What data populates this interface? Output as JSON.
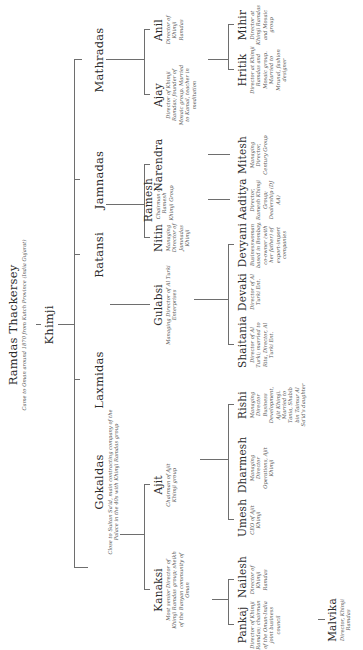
{
  "root": {
    "name": "Ramdas Thackersey",
    "desc": "Came to Oman around 1870 from Kutch Province (India Gujarat)"
  },
  "gen1": {
    "name": "Khimji"
  },
  "gen2": [
    {
      "name": "Gokaldas",
      "desc": "Close to Sultan Sa'id, main contracting company of the Palace in the 40s with Khimji Ramdas group"
    },
    {
      "name": "Laxmidas",
      "desc": ""
    },
    {
      "name": "Ratansi",
      "desc": ""
    },
    {
      "name": "Jamnadas",
      "desc": ""
    },
    {
      "name": "Mathradas",
      "desc": ""
    }
  ],
  "gen3": [
    {
      "name": "Kanaksi",
      "desc": "Most senior Director of Khimji Ramdas group; sheikh of the Banyan community of Oman"
    },
    {
      "name": "Ajit",
      "desc": "Chairman of Ajit Khimji group"
    },
    {
      "name": "Gulabsi",
      "desc": "Managing Director of Al Turki Enterprises"
    },
    {
      "name": "Nitin",
      "desc": "Managing Director of Jamnadas Khimji"
    },
    {
      "name": "Ramesh",
      "desc": "Chairman of Ramesh Khimji Group"
    },
    {
      "name": "Narendra",
      "desc": ""
    },
    {
      "name": "Ajay",
      "desc": "Director of Khimji Ramdas; founder of Mosaic group. Married to Kamal, teacher in meditation"
    },
    {
      "name": "Anil",
      "desc": "Director of Khimji Ramdas"
    }
  ],
  "gen4": [
    {
      "name": "Pankaj",
      "desc": "Director of Khimji Ramdas; chairman of the Oman-India joint business council"
    },
    {
      "name": "Nailesh",
      "desc": "Director of Khimji Ramdas"
    },
    {
      "name": "Umesh",
      "desc": "CEO of Ajit Khimji"
    },
    {
      "name": "Dharmesh",
      "desc": "Managing Director Operations, Ajit Khimji"
    },
    {
      "name": "Rishi",
      "desc": "Managing Director Business Development, Ajit Khimji. Married to Tania, Shabib bin Taimur Al Sa'id's daughter"
    },
    {
      "name": "Shaitania",
      "desc": "Director of Al Turki; married to Rita, Director, Al Turki Ent."
    },
    {
      "name": "Devaki",
      "desc": "Director of Al Turki Ent."
    },
    {
      "name": "Devyani",
      "desc": "Businesswoman based in Bombay, co-owner (with her father) of export-import companies"
    },
    {
      "name": "Aaditya",
      "desc": "Director, Ramesh Khimji Group; Dealership (DJ AA)"
    },
    {
      "name": "Mitesh",
      "desc": "Managing Director, Century Group"
    },
    {
      "name": "Hritik",
      "desc": "Director at Khimji Ramdas and Mosaic group. Married to Mrunal, fashion designer"
    },
    {
      "name": "Mihir",
      "desc": "Director at Khimji Ramdas and Mosaic group"
    }
  ],
  "gen5": [
    {
      "name": "Malvika",
      "desc": "Director, Khimji Ramdas"
    }
  ]
}
